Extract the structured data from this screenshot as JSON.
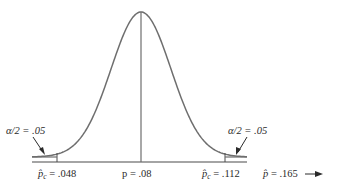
{
  "figure": {
    "type": "normal-distribution-rejection-regions",
    "curve_color": "#6e6e6e",
    "axis_color": "#4a4a4a",
    "text_color": "#2a2a2a"
  },
  "labels": {
    "alpha_left": "α/2 = .05",
    "alpha_right": "α/2 = .05",
    "crit_left_symbol": "p̂",
    "crit_left_sub": "c",
    "crit_left_value": " = .048",
    "center": "p = .08",
    "crit_right_symbol": "p̂",
    "crit_right_sub": "c",
    "crit_right_value": " = .112",
    "observed_symbol": "p̂",
    "observed_value": " = .165"
  },
  "chart_data": {
    "type": "diagram",
    "center": 0.08,
    "critical_values": [
      0.048,
      0.112
    ],
    "tail_area_each": 0.05,
    "observed_value": 0.165,
    "annotations": [
      "α/2 = .05",
      "α/2 = .05",
      "p̂c = .048",
      "p = .08",
      "p̂c = .112",
      "p̂ = .165 →"
    ]
  }
}
